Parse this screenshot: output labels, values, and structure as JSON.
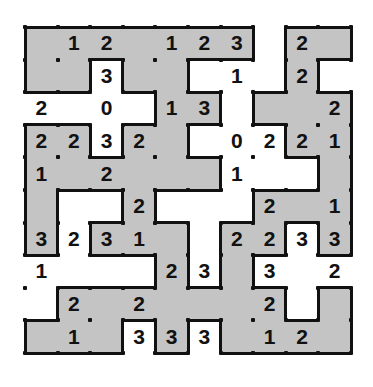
{
  "puzzle": {
    "type": "slitherlink-style shaded region puzzle",
    "rows": 10,
    "cols": 10,
    "colors": {
      "shaded": "#c4c4c4",
      "unshaded": "#ffffff",
      "line": "#111111"
    },
    "shading": [
      "GGGGGGGWGG",
      "GGWGGWWWGW",
      "WWWWGGWGGG",
      "GGWGGWWWGG",
      "GGGGGGWWWG",
      "GWWGWWWGGG",
      "GWGGGWGGWG",
      "WWWWGWGWWW",
      "WGGGGGGGWG",
      "GGGWGWGGGG"
    ],
    "clues": [
      [
        "",
        "1",
        "2",
        "",
        "1",
        "2",
        "3",
        "",
        "2",
        ""
      ],
      [
        "",
        "",
        "3",
        "",
        "",
        "",
        "1",
        "",
        "2",
        ""
      ],
      [
        "2",
        "",
        "0",
        "",
        "1",
        "3",
        "",
        "",
        "",
        "2"
      ],
      [
        "2",
        "2",
        "3",
        "2",
        "",
        "",
        "0",
        "2",
        "2",
        "1"
      ],
      [
        "1",
        "",
        "2",
        "",
        "",
        "",
        "1",
        "",
        "",
        ""
      ],
      [
        "",
        "",
        "",
        "2",
        "",
        "",
        "",
        "2",
        "",
        "1"
      ],
      [
        "3",
        "2",
        "3",
        "1",
        "",
        "",
        "2",
        "2",
        "3",
        "3"
      ],
      [
        "1",
        "",
        "",
        "",
        "2",
        "3",
        "",
        "3",
        "",
        "2"
      ],
      [
        "",
        "2",
        "",
        "2",
        "",
        "",
        "",
        "2",
        "",
        ""
      ],
      [
        "",
        "1",
        "",
        "3",
        "3",
        "3",
        "",
        "1",
        "2",
        ""
      ]
    ]
  }
}
